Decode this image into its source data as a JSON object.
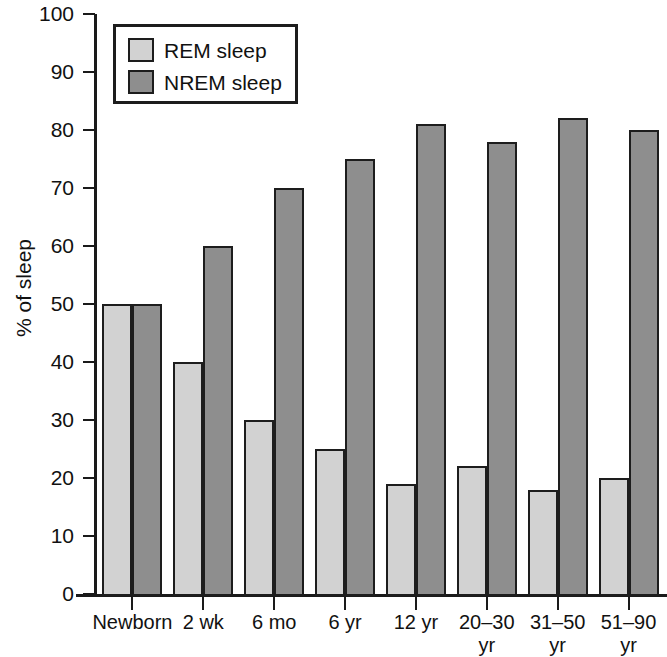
{
  "chart_data": {
    "type": "bar",
    "title": "",
    "subtitle": "",
    "xlabel": "",
    "ylabel": "% of sleep",
    "ylim": [
      0,
      100
    ],
    "ytick_step": 10,
    "yticks": [
      0,
      10,
      20,
      30,
      40,
      50,
      60,
      70,
      80,
      90,
      100
    ],
    "grid": false,
    "legend_position": "top-left",
    "categories": [
      "Newborn",
      "2 wk",
      "6 mo",
      "6 yr",
      "12 yr",
      "20–30\nyr",
      "31–50\nyr",
      "51–90\nyr"
    ],
    "series": [
      {
        "name": "REM sleep",
        "color": "#d2d2d2",
        "values": [
          50,
          40,
          30,
          25,
          19,
          22,
          18,
          20
        ]
      },
      {
        "name": "NREM sleep",
        "color": "#8e8e8e",
        "values": [
          50,
          60,
          70,
          75,
          81,
          78,
          82,
          80
        ]
      }
    ]
  },
  "legend": {
    "entries": [
      {
        "label": "REM sleep",
        "swatch": "rem"
      },
      {
        "label": "NREM sleep",
        "swatch": "nrem"
      }
    ]
  },
  "axis": {
    "y_title": "% of sleep"
  }
}
